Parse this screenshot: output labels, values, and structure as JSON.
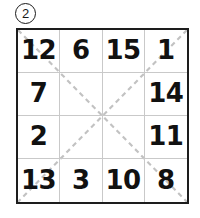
{
  "problem": {
    "label": "2",
    "label_style": "circled-number"
  },
  "grid": {
    "rows": 4,
    "columns": 4,
    "border_color": "#1d1d1d",
    "gridline_color": "#c9c9c9",
    "background": "#ffffff",
    "cells": [
      {
        "value": "12"
      },
      {
        "value": "6"
      },
      {
        "value": "15"
      },
      {
        "value": "1"
      },
      {
        "value": "7"
      },
      {
        "value": ""
      },
      {
        "value": ""
      },
      {
        "value": "14"
      },
      {
        "value": "2"
      },
      {
        "value": ""
      },
      {
        "value": ""
      },
      {
        "value": "11"
      },
      {
        "value": "13"
      },
      {
        "value": "3"
      },
      {
        "value": "10"
      },
      {
        "value": "8"
      }
    ]
  },
  "diagonals": {
    "color": "#c2c2c2",
    "dash_pattern": "5 4",
    "stroke_width": 2.2,
    "lines": [
      {
        "name": "diagonal-top-left-to-bottom-right",
        "x1": 0,
        "y1": 0,
        "x2": 173,
        "y2": 176
      },
      {
        "name": "diagonal-top-right-to-bottom-left",
        "x1": 173,
        "y1": 0,
        "x2": 0,
        "y2": 176
      }
    ]
  }
}
